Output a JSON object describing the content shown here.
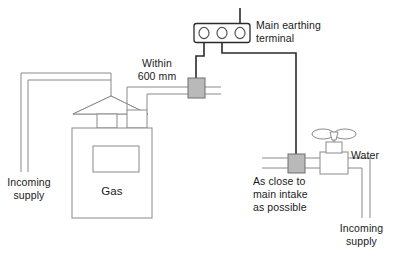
{
  "diagram": {
    "colors": {
      "line": "#6e6e6e",
      "line_dark": "#2b2b2b",
      "clamp_fill": "#b9b9b9",
      "clamp_stroke": "#6e6e6e",
      "text": "#1a1a1a",
      "background": "#ffffff"
    },
    "labels": {
      "main_earthing_terminal_l1": "Main earthing",
      "main_earthing_terminal_l2": "terminal",
      "within_l1": "Within",
      "within_l2": "600 mm",
      "gas": "Gas",
      "incoming_supply_left_l1": "Incoming",
      "incoming_supply_left_l2": "supply",
      "as_close_l1": "As close to",
      "as_close_l2": "main intake",
      "as_close_l3": "as possible",
      "water": "Water",
      "incoming_supply_right_l1": "Incoming",
      "incoming_supply_right_l2": "supply"
    },
    "components": [
      {
        "name": "main-earthing-terminal",
        "type": "terminal-block",
        "holes": 3
      },
      {
        "name": "gas-meter",
        "type": "meter",
        "label": "Gas"
      },
      {
        "name": "gas-bonding-clamp",
        "type": "clamp"
      },
      {
        "name": "water-bonding-clamp",
        "type": "clamp"
      },
      {
        "name": "water-stop-valve",
        "type": "valve-handwheel"
      },
      {
        "name": "gas-regulator-cone",
        "type": "cone"
      }
    ]
  }
}
